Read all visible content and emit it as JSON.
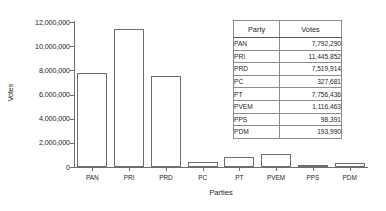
{
  "chart_data": {
    "type": "bar",
    "title": "",
    "xlabel": "Parties",
    "ylabel": "Votes",
    "categories": [
      "PAN",
      "PRI",
      "PRD",
      "PC",
      "PT",
      "PVEM",
      "PPS",
      "PDM"
    ],
    "values": [
      7792290,
      11445852,
      7519914,
      327681,
      7756436,
      1116463,
      98391,
      193990
    ],
    "plotted_values": [
      7792290,
      11445852,
      7519914,
      430000,
      800000,
      1116463,
      193990,
      290000
    ],
    "ylim": [
      0,
      12000000
    ],
    "ytick_labels": [
      "0",
      "2,000,000",
      "4,000,000",
      "6,000,000",
      "8,000,000",
      "10,000,000",
      "12,000,000"
    ],
    "ytick_values": [
      0,
      2000000,
      4000000,
      6000000,
      8000000,
      10000000,
      12000000
    ],
    "grid": false,
    "legend": false
  },
  "table": {
    "headers": [
      "Party",
      "Votes"
    ],
    "rows": [
      {
        "party": "PAN",
        "votes": "7,792,290"
      },
      {
        "party": "PRI",
        "votes": "11,445,852"
      },
      {
        "party": "PRD",
        "votes": "7,519,914"
      },
      {
        "party": "PC",
        "votes": "327,681"
      },
      {
        "party": "PT",
        "votes": "7,756,436"
      },
      {
        "party": "PVEM",
        "votes": "1,116,463"
      },
      {
        "party": "PPS",
        "votes": "98,391"
      },
      {
        "party": "PDM",
        "votes": "193,990"
      }
    ]
  },
  "colors": {
    "bar_fill": "#ffffff",
    "bar_stroke": "#6d6e71",
    "axis": "#6d6e71",
    "text": "#231f20",
    "table_border": "#58595b",
    "background": "#ffffff"
  }
}
